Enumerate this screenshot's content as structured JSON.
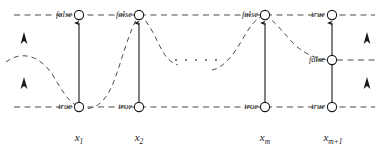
{
  "figure": {
    "colors": {
      "ink": "#1a1a1a",
      "dash": "#4a4a4a",
      "background": "#ffffff"
    },
    "rows": {
      "top_y": 15,
      "middle_y": 60,
      "bottom_y": 107
    },
    "ellipsis": "· · · · ·"
  },
  "columns": [
    {
      "id": "x1",
      "cx": 79,
      "var_base": "x",
      "var_sub": "1",
      "top_node": {
        "label": "false",
        "cy": 15,
        "filled": false
      },
      "bottom_node": {
        "label": "true",
        "cy": 107,
        "filled": false
      },
      "arrow": {
        "from_y": 107,
        "to_y": 15
      }
    },
    {
      "id": "x2",
      "cx": 139,
      "var_base": "x",
      "var_sub": "2",
      "top_node": {
        "label": "false",
        "cy": 15,
        "filled": false
      },
      "bottom_node": {
        "label": "true",
        "cy": 107,
        "filled": false
      },
      "arrow": {
        "from_y": 107,
        "to_y": 15
      }
    },
    {
      "id": "xm",
      "cx": 265,
      "var_base": "x",
      "var_sub": "m",
      "top_node": {
        "label": "false",
        "cy": 15,
        "filled": false
      },
      "bottom_node": {
        "label": "true",
        "cy": 107,
        "filled": false
      },
      "arrow": {
        "from_y": 107,
        "to_y": 15
      }
    },
    {
      "id": "xm1",
      "cx": 332,
      "var_base": "x",
      "var_sub": "m+1",
      "top_node": {
        "label": "true",
        "cy": 15,
        "filled": false
      },
      "middle_node": {
        "label": "false",
        "cy": 60,
        "filled": false
      },
      "bottom_node": {
        "label": "true",
        "cy": 107,
        "filled": false
      },
      "arrow": {
        "from_y": 107,
        "to_y": 15
      }
    }
  ],
  "guide_lines": [
    {
      "name": "top-guide",
      "y": 15,
      "x1": 14,
      "x2": 375
    },
    {
      "name": "middle-guide-right",
      "y": 60,
      "x1": 331,
      "x2": 378
    },
    {
      "name": "bottom-guide",
      "y": 107,
      "x1": 14,
      "x2": 375
    }
  ],
  "side_arrows": [
    {
      "name": "left-upper-arrow",
      "x": 24,
      "y": 40
    },
    {
      "name": "left-lower-arrow",
      "x": 24,
      "y": 85
    },
    {
      "name": "right-upper-arrow",
      "x": 367,
      "y": 40
    },
    {
      "name": "right-lower-arrow",
      "x": 367,
      "y": 85
    }
  ]
}
